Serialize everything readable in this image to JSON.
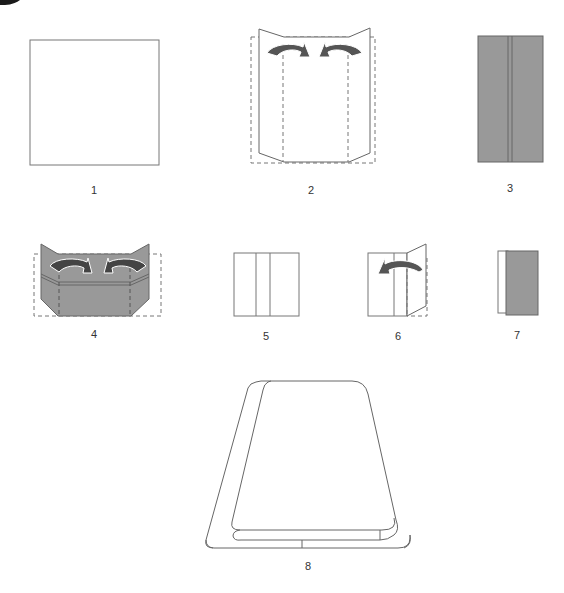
{
  "diagram": {
    "colors": {
      "paper_front": "#ffffff",
      "paper_back": "#999999",
      "outline": "#666666",
      "arrow": "#555555",
      "crease_dash": "#777777"
    },
    "steps": [
      {
        "number": "1",
        "description": "Square sheet of paper"
      },
      {
        "number": "2",
        "description": "Fold left and right edges to center along dashed lines"
      },
      {
        "number": "3",
        "description": "Result: colored side with center seam"
      },
      {
        "number": "4",
        "description": "Fold corners inward along dashed lines"
      },
      {
        "number": "5",
        "description": "Square divided into three panels"
      },
      {
        "number": "6",
        "description": "Fold right flap over to the left"
      },
      {
        "number": "7",
        "description": "Folded result with colored side showing"
      },
      {
        "number": "8",
        "description": "Finished fold shown in perspective"
      }
    ]
  }
}
